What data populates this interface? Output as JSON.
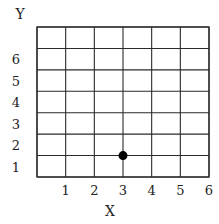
{
  "chart_data": {
    "type": "scatter",
    "title": "",
    "xlabel": "X",
    "ylabel": "Y",
    "xlim": [
      0,
      6
    ],
    "ylim": [
      0,
      7
    ],
    "grid": true,
    "x_ticks": [
      1,
      2,
      3,
      4,
      5,
      6
    ],
    "y_ticks": [
      1,
      2,
      3,
      4,
      5,
      6
    ],
    "x_tick_labels": [
      "1",
      "2",
      "3",
      "4",
      "5",
      "6"
    ],
    "y_tick_labels": [
      "1",
      "2",
      "3",
      "4",
      "5",
      "6"
    ],
    "points": [
      {
        "x": 3,
        "y": 1
      }
    ],
    "point_color": "#000000",
    "grid_color": "#2a2a2a"
  }
}
